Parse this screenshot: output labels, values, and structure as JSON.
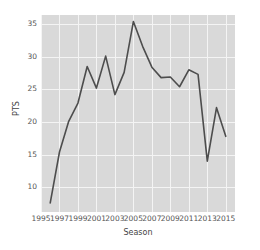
{
  "chart_data": {
    "type": "line",
    "title": "",
    "xlabel": "Season",
    "ylabel": "PTS",
    "x": [
      1996,
      1997,
      1998,
      1999,
      2000,
      2001,
      2002,
      2003,
      2004,
      2005,
      2006,
      2007,
      2008,
      2009,
      2010,
      2011,
      2012,
      2013,
      2014,
      2015
    ],
    "values": [
      7.6,
      15.4,
      20.1,
      22.9,
      28.5,
      25.2,
      30.1,
      24.2,
      27.6,
      35.4,
      31.6,
      28.4,
      26.8,
      26.9,
      25.4,
      28.0,
      27.3,
      14.0,
      22.2,
      17.8
    ],
    "xlim": [
      1995,
      2016
    ],
    "ylim": [
      6.2,
      36.4
    ],
    "xticks": [
      1995,
      1997,
      1999,
      2001,
      2003,
      2005,
      2007,
      2009,
      2011,
      2013,
      2015
    ],
    "yticks": [
      10,
      15,
      20,
      25,
      30,
      35
    ],
    "xticklabels": [
      "1995",
      "1997",
      "1999",
      "2001",
      "2003",
      "2005",
      "2007",
      "2009",
      "2011",
      "2013",
      "2015"
    ],
    "yticklabels": [
      "10",
      "15",
      "20",
      "25",
      "30",
      "35"
    ],
    "grid": true,
    "legend": null,
    "line_color": "#4d4d4d",
    "plot_background": "#d9d9d9",
    "grid_color": "#f4f4f4",
    "figure_background": "#ffffff"
  }
}
